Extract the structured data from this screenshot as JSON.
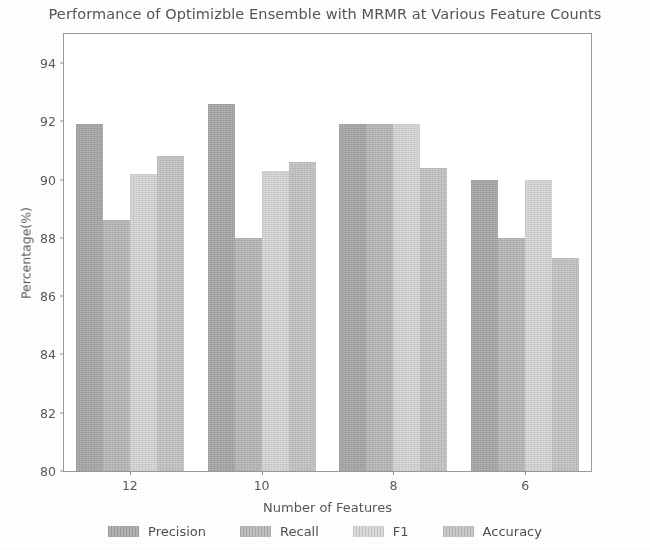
{
  "chart_data": {
    "type": "bar",
    "title": "Performance of Optimizble Ensemble with MRMR at Various Feature Counts",
    "xlabel": "Number of Features",
    "ylabel": "Percentage(%)",
    "categories": [
      "12",
      "10",
      "8",
      "6"
    ],
    "ylim": [
      80,
      95
    ],
    "yticks": [
      80,
      82,
      84,
      86,
      88,
      90,
      92,
      94
    ],
    "grid": false,
    "legend_position": "bottom",
    "series": [
      {
        "name": "Precision",
        "color": "#a8a8a8",
        "values": [
          91.9,
          92.6,
          91.9,
          90.0
        ]
      },
      {
        "name": "Recall",
        "color": "#b8b8b8",
        "values": [
          88.6,
          88.0,
          91.9,
          88.0
        ]
      },
      {
        "name": "F1",
        "color": "#d6d6d6",
        "values": [
          90.2,
          90.3,
          91.9,
          90.0
        ]
      },
      {
        "name": "Accuracy",
        "color": "#c4c4c4",
        "values": [
          90.8,
          90.6,
          90.4,
          87.3
        ]
      }
    ]
  }
}
